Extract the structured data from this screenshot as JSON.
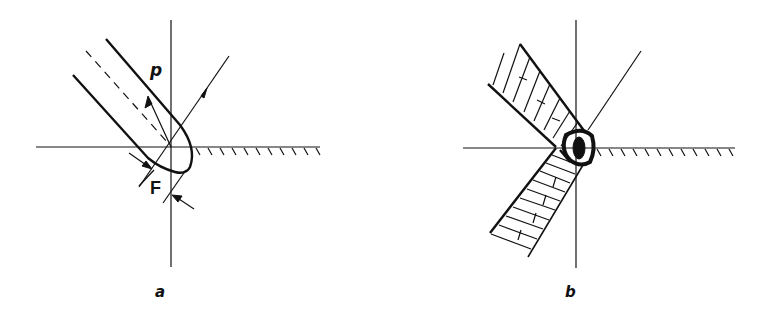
{
  "figure": {
    "panels": [
      {
        "id": "a",
        "caption": "a",
        "labels": {
          "p": "p",
          "f": "F"
        },
        "elements": [
          "vertical-axis",
          "horizontal-surface",
          "hatched-surface",
          "incident-ray",
          "beam-outline",
          "beam-axis-dashed",
          "reflected-arrow",
          "force-arrows"
        ]
      },
      {
        "id": "b",
        "caption": "b",
        "elements": [
          "vertical-axis",
          "horizontal-surface",
          "hatched-surface",
          "incident-ray",
          "upper-hatched-band",
          "lower-hatched-band",
          "central-knot"
        ]
      }
    ],
    "colors": {
      "ink": "#111111",
      "background": "#ffffff"
    }
  }
}
